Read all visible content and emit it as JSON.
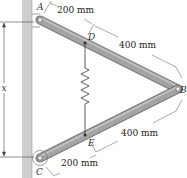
{
  "diagram": {
    "points": {
      "A": {
        "label": "A"
      },
      "B": {
        "label": "B"
      },
      "C": {
        "label": "C"
      },
      "D": {
        "label": "D"
      },
      "E": {
        "label": "E"
      }
    },
    "dimensions": {
      "AD": "200 mm",
      "DB": "400 mm",
      "EB": "400 mm",
      "CE": "200 mm",
      "x": "x"
    },
    "colors": {
      "wall": "#c8c8c8",
      "bar": "#9a9a9a",
      "bar_edge": "#6e6e6e",
      "line": "#333333"
    }
  }
}
